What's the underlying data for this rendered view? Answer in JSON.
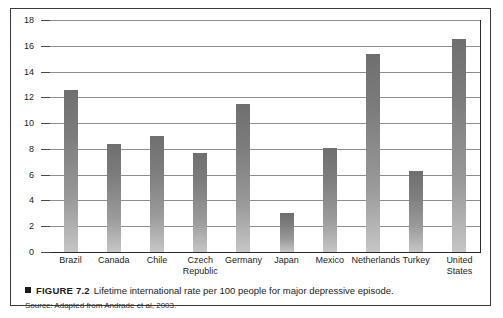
{
  "chart_data": {
    "type": "bar",
    "title": "Lifetime international rate per 100 people for major depressive episode.",
    "xlabel": "",
    "ylabel": "",
    "ylim": [
      0,
      18
    ],
    "ytick_step": 2,
    "yticks": [
      0,
      2,
      4,
      6,
      8,
      10,
      12,
      14,
      16,
      18
    ],
    "grid": true,
    "legend": "none",
    "categories": [
      "Brazil",
      "Canada",
      "Chile",
      "Czech\nRepublic",
      "Germany",
      "Japan",
      "Mexico",
      "Netherlands",
      "Turkey",
      "United\nStates"
    ],
    "values": [
      12.6,
      8.4,
      9.0,
      7.7,
      11.5,
      3.0,
      8.1,
      15.4,
      6.3,
      16.5
    ],
    "bar_color_top": "#6f6f6f",
    "bar_color_bottom": "#c6c6c6"
  },
  "caption": {
    "marker": "square-bullet",
    "figure_label": "FIGURE 7.2",
    "text": "Lifetime international rate per 100 people for major depressive episode.",
    "source": "Source: Adapted from Andrade et al, 2003."
  }
}
